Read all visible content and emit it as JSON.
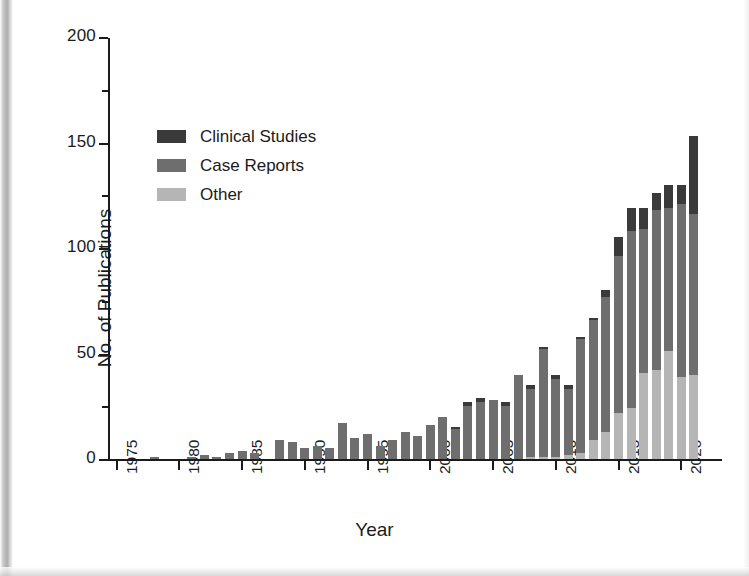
{
  "figure": {
    "y_axis_title": "No. of Publications",
    "x_axis_title": "Year"
  },
  "legend": {
    "items": [
      {
        "label": "Clinical Studies",
        "color": "#3a3a3a",
        "key": "clinical_studies"
      },
      {
        "label": "Case Reports",
        "color": "#6e6e6e",
        "key": "case_reports"
      },
      {
        "label": "Other",
        "color": "#b5b5b5",
        "key": "other"
      }
    ]
  },
  "chart_data": {
    "type": "bar",
    "stacked": true,
    "title": "",
    "subtitle": "",
    "xlabel": "Year",
    "ylabel": "No. of Publications",
    "xlim": [
      1975,
      2021
    ],
    "ylim": [
      0,
      200
    ],
    "ytick_values": [
      0,
      50,
      100,
      150,
      200
    ],
    "ytick_labels": [
      "0",
      "50",
      "100",
      "150",
      "200"
    ],
    "yminor_tick_values": [
      25,
      75,
      125,
      175
    ],
    "xtick_values": [
      1975,
      1980,
      1985,
      1990,
      1995,
      2000,
      2005,
      2010,
      2015,
      2020
    ],
    "xtick_labels": [
      "1975",
      "1980",
      "1985",
      "1990",
      "1995",
      "2000",
      "2005",
      "2010",
      "2015",
      "2020"
    ],
    "xtick_label_rotation": -90,
    "grid": false,
    "legend_position": "upper left inside",
    "categories": [
      1975,
      1976,
      1977,
      1978,
      1979,
      1980,
      1981,
      1982,
      1983,
      1984,
      1985,
      1986,
      1987,
      1988,
      1989,
      1990,
      1991,
      1992,
      1993,
      1994,
      1995,
      1996,
      1997,
      1998,
      1999,
      2000,
      2001,
      2002,
      2003,
      2004,
      2005,
      2006,
      2007,
      2008,
      2009,
      2010,
      2011,
      2012,
      2013,
      2014,
      2015,
      2016,
      2017,
      2018,
      2019,
      2020,
      2021
    ],
    "series": [
      {
        "name": "Other",
        "color": "#b5b5b5",
        "values": [
          0,
          0,
          0,
          0,
          0,
          0,
          0,
          0,
          0,
          0,
          0,
          0,
          0,
          0,
          0,
          0,
          0,
          0,
          0,
          0,
          0,
          0,
          0,
          0,
          0,
          0,
          0,
          0,
          0,
          0,
          0,
          0,
          0,
          1,
          1,
          1,
          2,
          3,
          9,
          13,
          22,
          24,
          41,
          42,
          51,
          39,
          40
        ]
      },
      {
        "name": "Case Reports",
        "color": "#6e6e6e",
        "values": [
          0,
          0,
          0,
          1,
          0,
          0,
          1,
          2,
          1,
          3,
          4,
          3,
          0,
          9,
          8,
          5,
          6,
          5,
          17,
          10,
          12,
          6,
          9,
          13,
          11,
          16,
          20,
          14,
          25,
          27,
          28,
          25,
          40,
          32,
          51,
          37,
          31,
          54,
          57,
          64,
          74,
          84,
          68,
          76,
          68,
          82,
          76
        ]
      },
      {
        "name": "Clinical Studies",
        "color": "#3a3a3a",
        "values": [
          0,
          0,
          0,
          0,
          0,
          0,
          0,
          0,
          0,
          0,
          0,
          0,
          0,
          0,
          0,
          0,
          0,
          0,
          0,
          0,
          0,
          0,
          0,
          0,
          0,
          0,
          0,
          1,
          2,
          2,
          0,
          2,
          0,
          2,
          1,
          2,
          2,
          1,
          1,
          3,
          9,
          11,
          10,
          8,
          11,
          9,
          37
        ]
      }
    ],
    "totals": [
      0,
      0,
      0,
      1,
      0,
      0,
      1,
      2,
      1,
      3,
      4,
      3,
      0,
      9,
      8,
      5,
      6,
      5,
      17,
      10,
      12,
      6,
      9,
      13,
      11,
      16,
      20,
      15,
      27,
      29,
      28,
      27,
      40,
      35,
      53,
      40,
      35,
      58,
      67,
      80,
      105,
      119,
      119,
      126,
      130,
      130,
      153
    ]
  }
}
